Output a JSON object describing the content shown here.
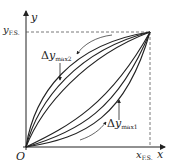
{
  "diagram": {
    "axes": {
      "y_label": "y",
      "x_label": "x",
      "origin_label": "O",
      "y_fs_label": {
        "main": "y",
        "sub": "F.S."
      },
      "x_fs_label": {
        "main": "x",
        "sub": "F.S."
      }
    },
    "annotations": [
      {
        "id": "dy_max2",
        "delta": "Δ",
        "main": "y",
        "sub": "max2",
        "arrow": "down"
      },
      {
        "id": "dy_max1",
        "delta": "Δ",
        "main": "y",
        "sub": "max1",
        "arrow": "up"
      }
    ],
    "curves": {
      "upper_group_count": 3,
      "lower_group_count": 3,
      "direction_upper": "returning (downward, toward origin)",
      "direction_lower": "ascending (upward, toward full scale)"
    },
    "colors": {
      "line": "#222222",
      "dashed": "#555555",
      "background": "#ffffff"
    }
  }
}
